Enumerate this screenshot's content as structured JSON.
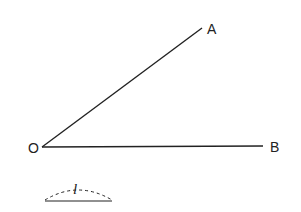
{
  "diagram": {
    "type": "angle",
    "points": {
      "O": {
        "label": "O",
        "x": 42,
        "y": 147
      },
      "A": {
        "label": "A",
        "x": 202,
        "y": 28
      },
      "B": {
        "label": "B",
        "x": 263,
        "y": 146
      }
    },
    "rays": [
      {
        "from": "O",
        "to": "A"
      },
      {
        "from": "O",
        "to": "B"
      }
    ],
    "length_marker": {
      "label": "l",
      "style": "dashed arc over segment"
    },
    "colors": {
      "stroke": "#222222",
      "background": "#ffffff"
    }
  }
}
